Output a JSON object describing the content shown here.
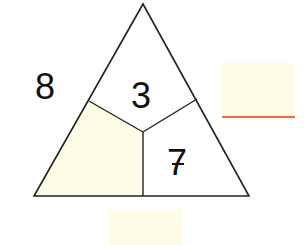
{
  "diagram": {
    "type": "number-triangle",
    "colors": {
      "stroke": "#222222",
      "fill_blank": "#FEFCE6",
      "fill_white": "#FFFFFF",
      "answer_line": "#E8703A"
    },
    "outer_labels": {
      "left_side": "8"
    },
    "sections": {
      "top": {
        "value": "3"
      },
      "bottom_right": {
        "value": "7"
      },
      "bottom_left": {
        "value": ""
      }
    },
    "answer_boxes": {
      "right_side": {
        "value": ""
      },
      "bottom": {
        "value": ""
      }
    }
  }
}
